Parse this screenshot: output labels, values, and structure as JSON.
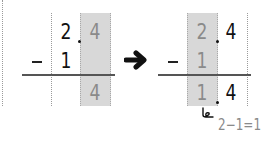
{
  "left_panel": {
    "top_row": {
      "ones": "2",
      "tenths": "4"
    },
    "subtrahend_row": {
      "operator": "−",
      "ones": "1"
    },
    "result_row": {
      "tenths": "4"
    },
    "highlighted_column": "tenths"
  },
  "arrow": {
    "icon": "right-arrow-icon",
    "glyph": "➜"
  },
  "right_panel": {
    "top_row": {
      "ones": "2",
      "tenths": "4"
    },
    "subtrahend_row": {
      "operator": "−",
      "ones": "1"
    },
    "result_row": {
      "ones": "1",
      "tenths": "4"
    },
    "highlighted_column": "ones",
    "annotation": "2−1=1"
  },
  "colors": {
    "shade": "#d8d8d8",
    "ink": "#111111",
    "highlight_digit": "#8a8a8a",
    "rule": "#555555"
  }
}
